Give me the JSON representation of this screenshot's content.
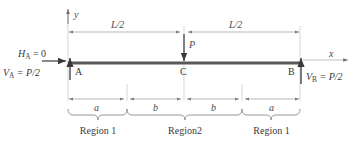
{
  "diagram": {
    "axes": {
      "y_label": "y",
      "x_label": "x"
    },
    "beam": {
      "color": "#595959",
      "left_x": 68,
      "right_x": 300,
      "y": 63
    },
    "supports": [
      {
        "name": "A",
        "label": "A",
        "x": 68
      },
      {
        "name": "C",
        "label": "C",
        "x": 184
      },
      {
        "name": "B",
        "label": "B",
        "x": 300
      }
    ],
    "reactions": [
      {
        "name": "horizontal-reaction-a",
        "symbol": "H",
        "subscript": "A",
        "equals": "= 0",
        "text": "Hₐ = 0"
      },
      {
        "name": "vertical-reaction-a",
        "symbol": "V",
        "subscript": "A",
        "equals": "= P/2",
        "text": "Vₐ = P/2"
      },
      {
        "name": "vertical-reaction-b",
        "symbol": "V",
        "subscript": "B",
        "equals": "= P/2",
        "text": "V_B = P/2"
      }
    ],
    "load": {
      "label": "P",
      "direction": "down",
      "at_point": "C"
    },
    "top_dimensions": [
      {
        "label": "L/2",
        "from": 68,
        "to": 184
      },
      {
        "label": "L/2",
        "from": 184,
        "to": 300
      }
    ],
    "bottom_dimensions": [
      {
        "label": "a",
        "from": 68,
        "to": 127
      },
      {
        "label": "b",
        "from": 127,
        "to": 184
      },
      {
        "label": "b",
        "from": 184,
        "to": 242
      },
      {
        "label": "a",
        "from": 242,
        "to": 300
      }
    ],
    "regions": [
      {
        "label": "Region 1",
        "from": 68,
        "to": 127
      },
      {
        "label": "Region2",
        "from": 127,
        "to": 242
      },
      {
        "label": "Region 1",
        "from": 242,
        "to": 300
      }
    ],
    "colors": {
      "beam": "#595959",
      "text": "#3a3a3a",
      "dimension_line": "#9a9a9a",
      "extension_line": "#bdbdbd",
      "arrow": "#4a4a4a"
    }
  }
}
